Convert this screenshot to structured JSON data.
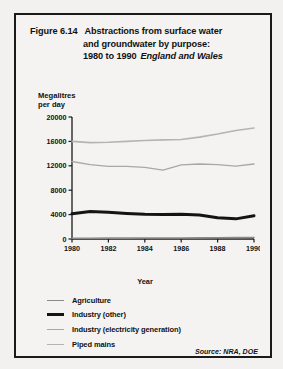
{
  "figure": {
    "number": "Figure 6.14",
    "title_line1": "Abstractions from surface water",
    "title_line2": "and groundwater by purpose:",
    "title_line3": "1980 to 1990",
    "region": "England and Wales",
    "source": "Source: NRA, DOE"
  },
  "axes": {
    "y_title": "Megalitres\nper day",
    "x_title": "Year"
  },
  "legend": {
    "items": [
      {
        "label": "Agriculture",
        "color": "#8a8a8a",
        "width": 1.6
      },
      {
        "label": "Industry (other)",
        "color": "#141414",
        "width": 3.0
      },
      {
        "label": "Industry (electricity generation)",
        "color": "#a8a8a8",
        "width": 1.4
      },
      {
        "label": "Piped mains",
        "color": "#b4b4b4",
        "width": 1.6
      }
    ]
  },
  "chart_data": {
    "type": "line",
    "title": "Abstractions from surface water and groundwater by purpose: 1980 to 1990",
    "subtitle": "England and Wales",
    "xlabel": "Year",
    "ylabel": "Megalitres per day",
    "x": [
      1980,
      1981,
      1982,
      1983,
      1984,
      1985,
      1986,
      1987,
      1988,
      1989,
      1990
    ],
    "xlim": [
      1980,
      1990
    ],
    "ylim": [
      0,
      20000
    ],
    "xticks": [
      1980,
      1982,
      1984,
      1986,
      1988,
      1990
    ],
    "yticks": [
      0,
      4000,
      8000,
      12000,
      16000,
      20000
    ],
    "grid": false,
    "legend_position": "below",
    "series": [
      {
        "name": "Piped mains",
        "color": "#b4b4b4",
        "width": 1.6,
        "values": [
          16000,
          15800,
          15850,
          16000,
          16150,
          16250,
          16300,
          16700,
          17200,
          17800,
          18200
        ]
      },
      {
        "name": "Industry (electricity generation)",
        "color": "#a8a8a8",
        "width": 1.4,
        "values": [
          12700,
          12200,
          11900,
          11900,
          11750,
          11300,
          12150,
          12300,
          12200,
          11950,
          12300
        ]
      },
      {
        "name": "Industry (other)",
        "color": "#141414",
        "width": 3.0,
        "values": [
          4150,
          4500,
          4400,
          4200,
          4050,
          4000,
          4050,
          3950,
          3500,
          3300,
          3800
        ]
      },
      {
        "name": "Agriculture",
        "color": "#8a8a8a",
        "width": 1.6,
        "values": [
          120,
          130,
          140,
          150,
          160,
          160,
          170,
          180,
          200,
          220,
          240
        ]
      }
    ]
  }
}
